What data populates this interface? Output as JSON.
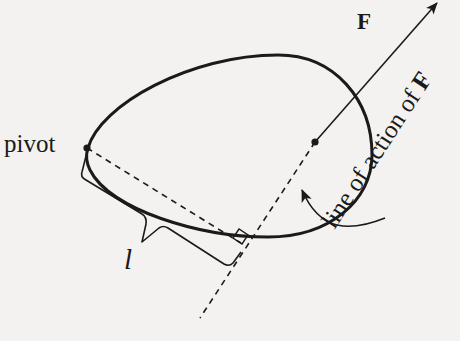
{
  "diagram": {
    "labels": {
      "pivot": "pivot",
      "force": "F",
      "lever_arm": "l",
      "line_of_action_prefix": "line of action of ",
      "line_of_action_force": "F"
    },
    "colors": {
      "ink": "#1a1a1a",
      "paper": "#f3f2f0"
    },
    "elements": [
      {
        "type": "closed-curve",
        "name": "rigid-body-outline"
      },
      {
        "type": "point",
        "name": "pivot-point",
        "at": [
          87,
          148
        ]
      },
      {
        "type": "point",
        "name": "force-application-point",
        "at": [
          315,
          142
        ]
      },
      {
        "type": "arrow",
        "name": "force-vector",
        "from": [
          315,
          142
        ],
        "to": [
          437,
          2
        ]
      },
      {
        "type": "dashed-line",
        "name": "line-of-action",
        "from": [
          315,
          142
        ],
        "to": [
          200,
          318
        ]
      },
      {
        "type": "dashed-line",
        "name": "lever-arm-line",
        "from": [
          87,
          148
        ],
        "to": [
          241,
          243
        ]
      },
      {
        "type": "right-angle-marker",
        "name": "perpendicular-marker",
        "at": [
          241,
          243
        ]
      },
      {
        "type": "brace",
        "name": "lever-arm-brace"
      },
      {
        "type": "curved-arrow",
        "name": "callout-arrow",
        "from": [
          385,
          218
        ],
        "to": [
          301,
          190
        ]
      }
    ]
  }
}
